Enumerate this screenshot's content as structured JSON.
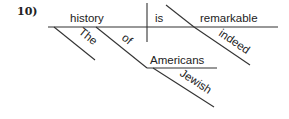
{
  "problem_number": "10)",
  "diagram": {
    "type": "reed-kellogg sentence diagram",
    "subject": "history",
    "verb": "is",
    "predicate_adjective": "remarkable",
    "modifiers": {
      "history": [
        "The",
        "of"
      ],
      "of_object": "Americans",
      "Americans": [
        "Jewish"
      ],
      "remarkable": [
        "indeed"
      ]
    },
    "words": {
      "subject": "history",
      "verb": "is",
      "complement": "remarkable",
      "article": "The",
      "preposition": "of",
      "prep_object": "Americans",
      "adjective": "Jewish",
      "adverb": "indeed"
    }
  }
}
